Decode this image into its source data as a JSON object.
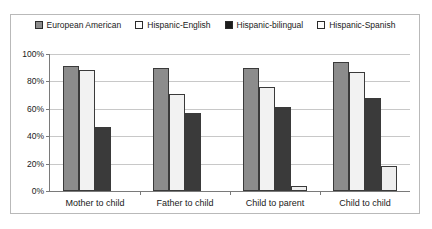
{
  "chart_data": {
    "type": "bar",
    "title": "",
    "xlabel": "",
    "ylabel": "",
    "ylim": [
      0,
      100
    ],
    "ytick_labels": [
      "100%",
      "80%",
      "60%",
      "40%",
      "20%",
      "0%"
    ],
    "ytick_values": [
      100,
      80,
      60,
      40,
      20,
      0
    ],
    "grid": true,
    "legend_position": "top-center",
    "categories": [
      "Mother to child",
      "Father to child",
      "Child to parent",
      "Child to child"
    ],
    "series": [
      {
        "name": "European American",
        "swatch": "gray",
        "color": "#8c8c8c",
        "values": [
          91,
          90,
          90,
          94
        ]
      },
      {
        "name": "Hispanic-English",
        "swatch": "white",
        "color": "#f2f2f2",
        "values": [
          88,
          71,
          76,
          87
        ]
      },
      {
        "name": "Hispanic-bilingual",
        "swatch": "black",
        "color": "#3a3a3a",
        "values": [
          47,
          57,
          61,
          68
        ]
      },
      {
        "name": "Hispanic-Spanish",
        "swatch": "white",
        "color": "#eeeeee",
        "values": [
          0,
          0,
          4,
          18
        ]
      }
    ]
  },
  "colors": {
    "frame_border": "#b9b9b9",
    "axis": "#7a7a7a",
    "gridline": "#c8c8c8",
    "text": "#1a1a1a"
  }
}
